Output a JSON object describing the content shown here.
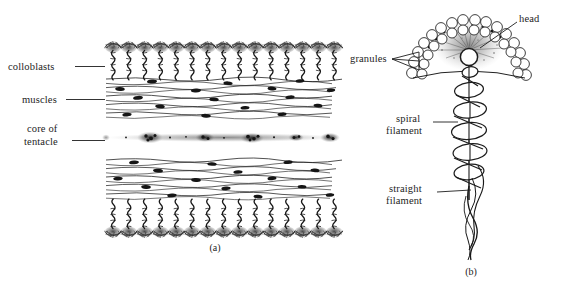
{
  "figure": {
    "background_color": "#ffffff",
    "ink_color": "#151515",
    "type": "biological-line-drawing"
  },
  "panel_a": {
    "caption": "(a)",
    "description": "Longitudinal section through a tentacle showing colloblast layers, muscle layers and the tentacle core",
    "labels": [
      {
        "id": "colloblasts",
        "text": "colloblasts",
        "lines": [
          "colloblasts"
        ]
      },
      {
        "id": "muscles",
        "text": "muscles",
        "lines": [
          "muscles"
        ]
      },
      {
        "id": "core-of-tentacle",
        "text": "core of tentacle",
        "lines": [
          "core of",
          "tentacle"
        ]
      }
    ],
    "layers": [
      {
        "id": "colloblast-top",
        "name": "colloblast layer (upper)"
      },
      {
        "id": "muscle-upper",
        "name": "muscle layer (upper)"
      },
      {
        "id": "tentacle-core",
        "name": "core of tentacle"
      },
      {
        "id": "muscle-lower",
        "name": "muscle layer (lower)"
      },
      {
        "id": "colloblast-bottom",
        "name": "colloblast layer (lower)"
      }
    ],
    "colloblast_count_top": 15,
    "colloblast_count_bottom": 15
  },
  "panel_b": {
    "caption": "(b)",
    "description": "Detail of a single colloblast showing head, granules, spiral filament and straight filament",
    "labels": [
      {
        "id": "head",
        "text": "head",
        "lines": [
          "head"
        ]
      },
      {
        "id": "granules",
        "text": "granules",
        "lines": [
          "granules"
        ]
      },
      {
        "id": "spiral-filament",
        "text": "spiral filament",
        "lines": [
          "spiral",
          "filament"
        ]
      },
      {
        "id": "straight-filament",
        "text": "straight filament",
        "lines": [
          "straight",
          "filament"
        ]
      }
    ],
    "parts": [
      {
        "id": "head-dome",
        "name": "head dome of granules"
      },
      {
        "id": "granule-arc",
        "name": "dotted granule arc"
      },
      {
        "id": "nucleus",
        "name": "central nucleus"
      },
      {
        "id": "spiral-coil",
        "name": "spiral filament helix"
      },
      {
        "id": "straight-axis",
        "name": "straight filament axis"
      }
    ],
    "spiral_coil_turns": 6,
    "granule_rows": 2
  }
}
